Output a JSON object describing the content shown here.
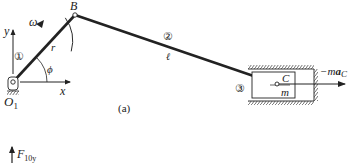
{
  "diagram": {
    "caption": "(a)",
    "points": {
      "pivot": "O",
      "pivot_sub": "1",
      "crank_end": "B",
      "slider_point": "C"
    },
    "links": {
      "crank_number": "①",
      "rod_number": "②",
      "slider_number": "③",
      "crank_length": "r",
      "rod_length": "ℓ"
    },
    "angle": "ϕ",
    "angular_velocity": "ω",
    "axes": {
      "x": "x",
      "y": "y"
    },
    "slider_mass": "m",
    "inertia_force": {
      "prefix": "−m",
      "a": "a",
      "sub": "C"
    },
    "force_label": {
      "main": "F",
      "sub": "10y"
    },
    "colors": {
      "line": "#222222",
      "background": "#ffffff"
    }
  }
}
